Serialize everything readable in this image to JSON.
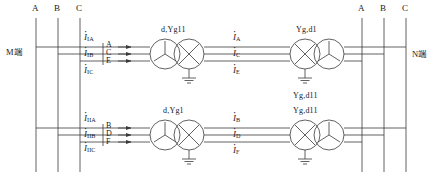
{
  "diagram": {
    "terminals": {
      "left": "M端",
      "right": "N端"
    },
    "bus_labels_left": [
      "A",
      "B",
      "C"
    ],
    "bus_labels_right": [
      "A",
      "B",
      "C"
    ],
    "transformers": [
      {
        "id": "xf-top-left",
        "label": "d,Yg11"
      },
      {
        "id": "xf-top-right",
        "label": "Yg,d1"
      },
      {
        "id": "xf-top-right-2",
        "label": "Yg,d11"
      },
      {
        "id": "xf-bottom-left",
        "label": "d,Yg1"
      },
      {
        "id": "xf-bottom-right",
        "label": "Yg,d11"
      }
    ],
    "currents_left_top": [
      {
        "sym": "I",
        "sub": "IA"
      },
      {
        "sym": "I",
        "sub": "IB"
      },
      {
        "sym": "I",
        "sub": "IC"
      }
    ],
    "currents_left_bottom": [
      {
        "sym": "I",
        "sub": "IIA"
      },
      {
        "sym": "I",
        "sub": "IIB"
      },
      {
        "sym": "I",
        "sub": "IIC"
      }
    ],
    "currents_mid_top": [
      {
        "sym": "I",
        "sub": "A"
      },
      {
        "sym": "I",
        "sub": "C"
      },
      {
        "sym": "I",
        "sub": "E"
      }
    ],
    "currents_mid_bottom": [
      {
        "sym": "I",
        "sub": "B"
      },
      {
        "sym": "I",
        "sub": "D"
      },
      {
        "sym": "I",
        "sub": "F"
      }
    ],
    "phase_marks_top": [
      "A",
      "C",
      "E"
    ],
    "phase_marks_bottom": [
      "B",
      "D",
      "F"
    ],
    "colors": {
      "line": "#3a3a3a",
      "text": "#1a1a1a",
      "background": "#ffffff"
    }
  }
}
